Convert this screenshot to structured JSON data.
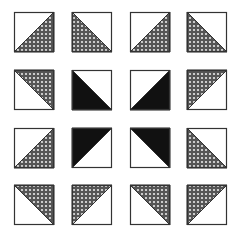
{
  "layout": {
    "cols": 4,
    "rows": 4,
    "col_x": [
      14,
      72,
      130,
      187
    ],
    "row_y": [
      12,
      70,
      128,
      185
    ],
    "tile_size": 40
  },
  "colors": {
    "outline": "#333333",
    "solid": "#111111",
    "hatch_bg": "#555555",
    "hatch_dot": "#e8e8e8",
    "background": "#ffffff"
  },
  "tiles": [
    {
      "row": 0,
      "col": 0,
      "fill": "hatched",
      "corner": "bottom-right"
    },
    {
      "row": 0,
      "col": 1,
      "fill": "hatched",
      "corner": "bottom-left"
    },
    {
      "row": 0,
      "col": 2,
      "fill": "hatched",
      "corner": "bottom-right"
    },
    {
      "row": 0,
      "col": 3,
      "fill": "hatched",
      "corner": "bottom-left"
    },
    {
      "row": 1,
      "col": 0,
      "fill": "hatched",
      "corner": "top-right"
    },
    {
      "row": 1,
      "col": 1,
      "fill": "solid",
      "corner": "bottom-left"
    },
    {
      "row": 1,
      "col": 2,
      "fill": "solid",
      "corner": "bottom-right"
    },
    {
      "row": 1,
      "col": 3,
      "fill": "hatched",
      "corner": "top-left"
    },
    {
      "row": 2,
      "col": 0,
      "fill": "hatched",
      "corner": "bottom-right"
    },
    {
      "row": 2,
      "col": 1,
      "fill": "solid",
      "corner": "top-left"
    },
    {
      "row": 2,
      "col": 2,
      "fill": "solid",
      "corner": "top-right"
    },
    {
      "row": 2,
      "col": 3,
      "fill": "hatched",
      "corner": "bottom-left"
    },
    {
      "row": 3,
      "col": 0,
      "fill": "hatched",
      "corner": "top-right"
    },
    {
      "row": 3,
      "col": 1,
      "fill": "hatched",
      "corner": "top-left"
    },
    {
      "row": 3,
      "col": 2,
      "fill": "hatched",
      "corner": "top-right"
    },
    {
      "row": 3,
      "col": 3,
      "fill": "hatched",
      "corner": "top-left"
    }
  ]
}
